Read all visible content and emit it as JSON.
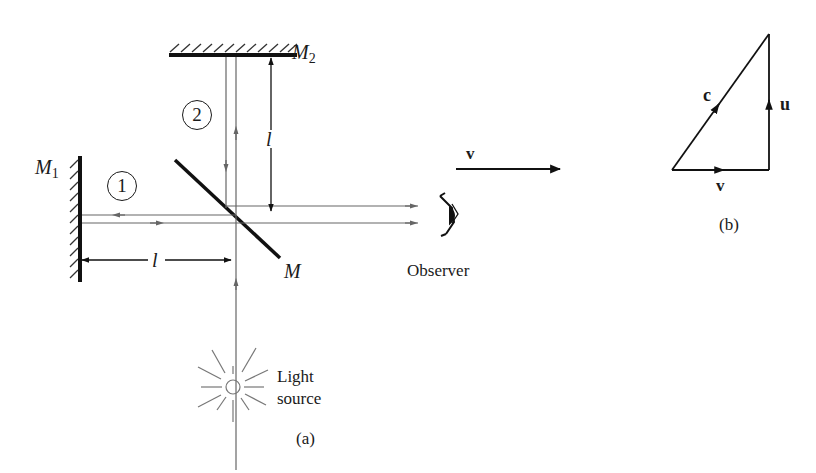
{
  "figure_a": {
    "caption": "(a)",
    "mirror_m1": {
      "label": "M",
      "subscript": "1"
    },
    "mirror_m2": {
      "label": "M",
      "subscript": "2"
    },
    "beam_splitter": {
      "label": "M"
    },
    "path_1": {
      "label": "1"
    },
    "path_2": {
      "label": "2"
    },
    "arm_length_horizontal": {
      "label": "l"
    },
    "arm_length_vertical": {
      "label": "l"
    },
    "velocity_arrow": {
      "label": "v"
    },
    "observer": {
      "label": "Observer"
    },
    "light_source": {
      "line1": "Light",
      "line2": "source"
    }
  },
  "figure_b": {
    "caption": "(b)",
    "hypotenuse": {
      "label": "c"
    },
    "vertical_side": {
      "label": "u"
    },
    "horizontal_side": {
      "label": "v"
    }
  },
  "colors": {
    "ink": "#1a1a1a",
    "ray": "#666666"
  }
}
